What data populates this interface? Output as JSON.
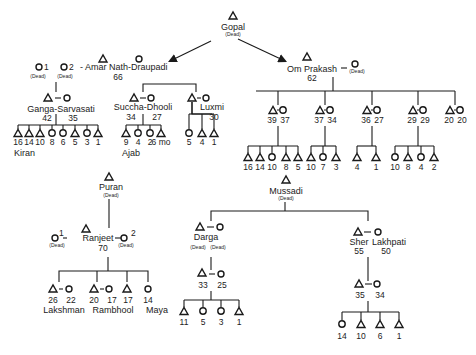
{
  "diagram": {
    "type": "kinship-genealogy",
    "legend_implied": {
      "triangle": "male",
      "circle": "female",
      "dash": "marriage"
    },
    "dead_label": "(Dead)",
    "root": {
      "name": "Gopal",
      "sex": "male",
      "status": "(Dead)"
    },
    "generation2": [
      {
        "id": "amar",
        "label": "- Amar Nath-Draupadi",
        "age": "66",
        "earlier_wives": [
          {
            "index": "1",
            "status": "(Dead)"
          },
          {
            "index": "2",
            "status": "(Dead)"
          }
        ]
      },
      {
        "id": "om",
        "label": "Om Prakash",
        "age": "62",
        "spouse_status": "(Dead)"
      }
    ],
    "amar_children": [
      {
        "couple": "Ganga-Sarvasati",
        "ages": [
          "42",
          "35"
        ],
        "children": [
          {
            "sex": "m",
            "age": "16",
            "name": "Kiran"
          },
          {
            "sex": "m",
            "age": "14"
          },
          {
            "sex": "m",
            "age": "10"
          },
          {
            "sex": "f",
            "age": "8"
          },
          {
            "sex": "f",
            "age": "6"
          },
          {
            "sex": "m",
            "age": "5"
          },
          {
            "sex": "f",
            "age": "3"
          },
          {
            "sex": "m",
            "age": "1"
          }
        ]
      },
      {
        "couple": "Succha-Dhooli",
        "ages": [
          "34",
          "27"
        ],
        "children": [
          {
            "sex": "m",
            "age": "9",
            "name": "Ajab"
          },
          {
            "sex": "f",
            "age": "4"
          },
          {
            "sex": "f",
            "age": "2"
          },
          {
            "sex": "m",
            "age": "6 mo"
          }
        ]
      },
      {
        "couple": "Luxmi",
        "ages": [
          "30"
        ],
        "children": [
          {
            "sex": "f",
            "age": "5"
          },
          {
            "sex": "m",
            "age": "4"
          },
          {
            "sex": "m",
            "age": "1"
          }
        ]
      }
    ],
    "om_children": [
      {
        "ages": [
          "39",
          "37"
        ],
        "children": [
          {
            "sex": "m",
            "age": "16"
          },
          {
            "sex": "m",
            "age": "14"
          },
          {
            "sex": "f",
            "age": "10"
          },
          {
            "sex": "m",
            "age": "8"
          },
          {
            "sex": "m",
            "age": "5"
          }
        ]
      },
      {
        "ages": [
          "37",
          "34"
        ],
        "children": [
          {
            "sex": "m",
            "age": "10"
          },
          {
            "sex": "f",
            "age": "7"
          },
          {
            "sex": "m",
            "age": "3"
          }
        ]
      },
      {
        "ages": [
          "36",
          "27"
        ],
        "children": [
          {
            "sex": "m",
            "age": "4"
          },
          {
            "sex": "m",
            "age": "1"
          }
        ]
      },
      {
        "ages": [
          "29",
          "29"
        ],
        "children": [
          {
            "sex": "f",
            "age": "10"
          },
          {
            "sex": "m",
            "age": "8"
          },
          {
            "sex": "f",
            "age": "4"
          },
          {
            "sex": "m",
            "age": "2"
          }
        ]
      },
      {
        "ages": [
          "20",
          "20"
        ],
        "children": []
      }
    ],
    "mussadi": {
      "name": "Mussadi",
      "status": "(Dead)",
      "darga": {
        "name": "Darga",
        "status_husband": "(Dead)",
        "status_wife": "(Dead)",
        "son_couple_ages": [
          "33",
          "25"
        ],
        "grandchildren": [
          {
            "sex": "m",
            "age": "11"
          },
          {
            "sex": "f",
            "age": "5"
          },
          {
            "sex": "f",
            "age": "3"
          },
          {
            "sex": "m",
            "age": "1"
          }
        ]
      },
      "sher": {
        "name": "Sher",
        "age": "55",
        "wife": "Lakhpati",
        "wife_age": "50",
        "son_couple_ages": [
          "35",
          "34"
        ],
        "grandchildren": [
          {
            "sex": "f",
            "age": "14"
          },
          {
            "sex": "m",
            "age": "10"
          },
          {
            "sex": "m",
            "age": "6"
          },
          {
            "sex": "m",
            "age": "1"
          }
        ]
      }
    },
    "puran": {
      "name": "Puran",
      "status": "(Dead)",
      "ranjeet": {
        "name": "Ranjeet",
        "age": "70",
        "wife1_index": "1",
        "wife1_status": "(Dead)",
        "wife2_index": "2",
        "wife2_status": "(Dead)",
        "children": [
          {
            "type": "couple",
            "ages": [
              "26",
              "22"
            ],
            "name": "Lakshman"
          },
          {
            "type": "couple",
            "ages": [
              "20",
              "17"
            ],
            "name": "Rambhool"
          },
          {
            "type": "male",
            "age": "17"
          },
          {
            "type": "female",
            "age": "14",
            "name": "Maya"
          }
        ]
      }
    }
  }
}
